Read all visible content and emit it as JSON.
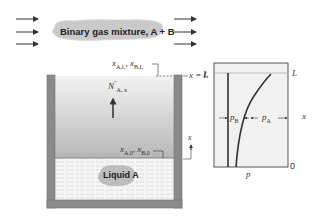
{
  "flow": {
    "label": "Binary gas mixture, A + B",
    "left_arrows": 3,
    "right_arrows": 3
  },
  "container": {
    "top_label": "x_{A,L}, x_{B,L}",
    "top_label_parts": {
      "x1": "x",
      "s1": "A,L",
      "sep": ", ",
      "x2": "x",
      "s2": "B,L"
    },
    "bottom_label_parts": {
      "x1": "x",
      "s1": "A,0",
      "sep": ", ",
      "x2": "x",
      "s2": "B,0"
    },
    "flux_label_parts": {
      "n": "N",
      "sup": "''",
      "sub": "A, x"
    },
    "xL_label": "x = L",
    "axis_label": "x",
    "liquid_label": "Liquid A"
  },
  "plot": {
    "L_left": "L",
    "L_right": "L",
    "zero": "0",
    "x_axis_label": "x",
    "p_label": "p",
    "pB_label": {
      "p": "p",
      "sub": "B"
    },
    "pA_label": {
      "p": "p",
      "sub": "A"
    }
  },
  "colors": {
    "wall": "#8a8a8a",
    "wall_border": "#6e6e6e",
    "gas_top": "#f2f2f2",
    "gas_bottom": "#b9b9b9",
    "liquid_bg": "#f4f4f4",
    "cloud": "#c8c8c8",
    "plot_bg": "#f1f1f1",
    "curve": "#3a3a3a"
  }
}
